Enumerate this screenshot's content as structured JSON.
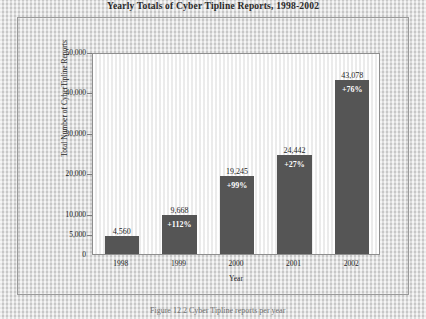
{
  "chart_data": {
    "type": "bar",
    "title": "Yearly Totals of Cyber Tipline Reports, 1998-2002",
    "xlabel": "Year",
    "ylabel": "Total Number of CyberTipline Reports",
    "categories": [
      "1998",
      "1999",
      "2000",
      "2001",
      "2002"
    ],
    "values": [
      4560,
      9668,
      19245,
      24442,
      43078
    ],
    "value_labels": [
      "4,560",
      "9,668",
      "19,245",
      "24,442",
      "43,078"
    ],
    "pct_change_labels": [
      "",
      "+112%",
      "+99%",
      "+27%",
      "+76%"
    ],
    "ylim": [
      0,
      50000
    ],
    "ytick_values": [
      0,
      5000,
      10000,
      20000,
      30000,
      40000,
      50000
    ],
    "ytick_labels": [
      "0",
      "5,000",
      "10,000",
      "20,000",
      "30,000",
      "40,000",
      "50,000"
    ],
    "grid": false,
    "legend": "none",
    "bar_color": "#555555",
    "plot_background": "#fbfbfb"
  },
  "caption": {
    "text": "Figure 12.2  Cyber Tipline reports per year"
  }
}
